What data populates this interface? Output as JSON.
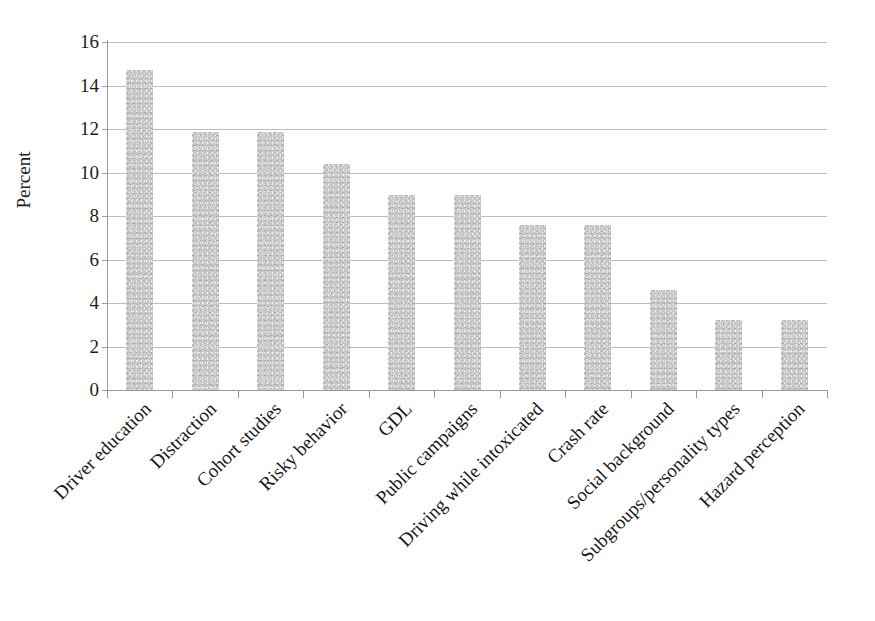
{
  "chart_data": {
    "type": "bar",
    "title": "",
    "subtitle": "",
    "xlabel": "",
    "ylabel": "Percent",
    "ylim": [
      0,
      16
    ],
    "ytick_step": 2,
    "yticks": [
      16,
      14,
      12,
      10,
      8,
      6,
      4,
      2,
      0
    ],
    "grid": true,
    "legend": false,
    "legend_position": "none",
    "orientation": "vertical",
    "categories": [
      "Driver education",
      "Distraction",
      "Cohort studies",
      "Risky behavior",
      "GDL",
      "Public campaigns",
      "Driving while intoxicated",
      "Crash rate",
      "Social background",
      "Subgroups/personality types",
      "Hazard perception"
    ],
    "values": [
      14.7,
      11.85,
      11.85,
      10.4,
      8.95,
      8.95,
      7.6,
      7.6,
      4.6,
      3.2,
      3.2
    ],
    "bar_color": "#c9c9c9",
    "grid_color": "#bdbdbd",
    "axis_color": "#9a9a9a",
    "text_color": "#1c1c1c",
    "label_rotation_degrees": 45
  }
}
